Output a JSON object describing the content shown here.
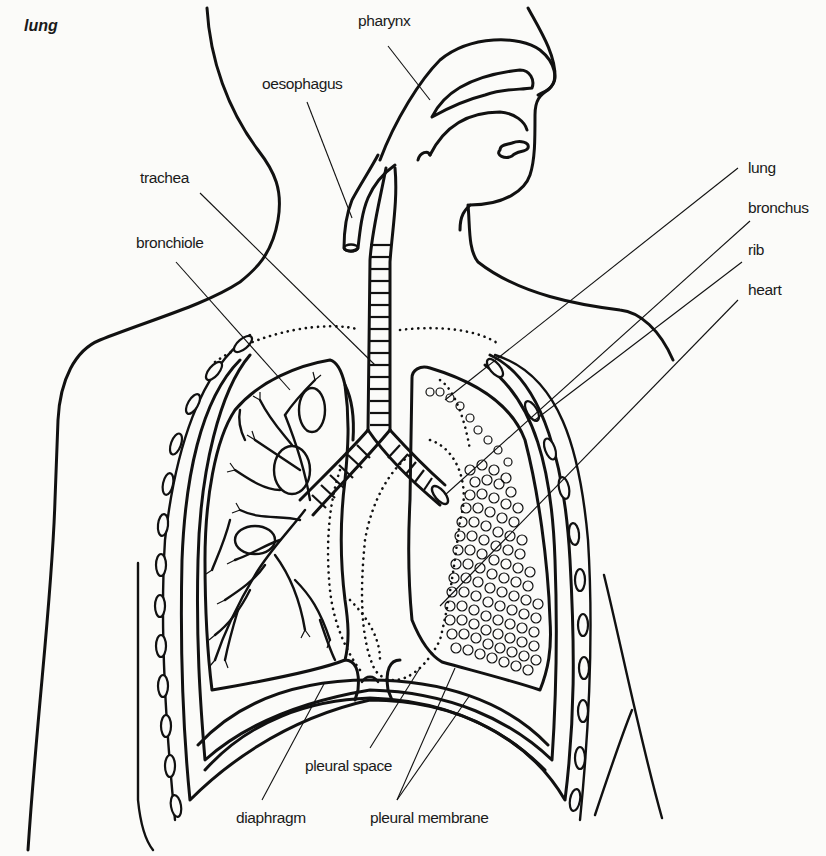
{
  "figure": {
    "title": "lung",
    "labels": {
      "pharynx": "pharynx",
      "oesophagus": "oesophagus",
      "trachea": "trachea",
      "bronchiole": "bronchiole",
      "lung": "lung",
      "bronchus": "bronchus",
      "rib": "rib",
      "heart": "heart",
      "pleural_space": "pleural space",
      "diaphragm": "diaphragm",
      "pleural_membrane": "pleural membrane"
    },
    "colors": {
      "background": "#fbfbf9",
      "ink": "#111111"
    }
  }
}
